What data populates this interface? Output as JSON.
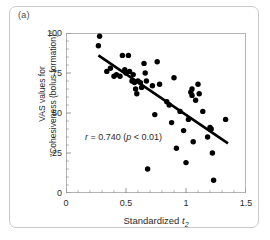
{
  "figure": {
    "panel_label": "(a)",
    "background_color": "#ffffff",
    "frame_color": "#c9c9c9"
  },
  "chart_data": {
    "type": "scatter",
    "title": "",
    "xlabel": "Standardized t2",
    "xlabel_parts": {
      "text": "Standardized ",
      "italic_symbol": "t",
      "subscript": "2"
    },
    "ylabel": "VAS values for \"Cohesiveness (bolus formation)\"",
    "ylabel_line1": "VAS values for",
    "ylabel_line2": "\"Cohesiveness (bolus formation)\"",
    "xlim": [
      0,
      1.5
    ],
    "ylim": [
      0,
      100
    ],
    "xticks": [
      0,
      0.5,
      1,
      1.5
    ],
    "xtick_labels": [
      "0",
      "0.5",
      "1",
      "1.5"
    ],
    "yticks": [
      0,
      25,
      50,
      75,
      100
    ],
    "ytick_labels": [
      "0",
      "25",
      "50",
      "75",
      "100"
    ],
    "xminor_tick_step": 0.1,
    "yminor_tick_step": 5,
    "grid": false,
    "legend": "none",
    "marker_color": "#000000",
    "marker_size": 4.2,
    "annotation": {
      "text": "r = 0.740 (p < 0.01)",
      "correlation_symbol": "r",
      "correlation_value": "0.740",
      "p_symbol": "p",
      "p_text": "< 0.01",
      "x": 0.26,
      "y": 27
    },
    "trendline": {
      "type": "linear-fit",
      "color": "#000000",
      "width": 2.6,
      "x_start": 0.27,
      "y_start": 86,
      "x_end": 1.35,
      "y_end": 31
    },
    "points": [
      {
        "x": 0.28,
        "y": 98
      },
      {
        "x": 0.27,
        "y": 92
      },
      {
        "x": 0.34,
        "y": 76
      },
      {
        "x": 0.37,
        "y": 78
      },
      {
        "x": 0.4,
        "y": 73
      },
      {
        "x": 0.42,
        "y": 74
      },
      {
        "x": 0.45,
        "y": 73
      },
      {
        "x": 0.47,
        "y": 86
      },
      {
        "x": 0.49,
        "y": 77
      },
      {
        "x": 0.5,
        "y": 75
      },
      {
        "x": 0.52,
        "y": 86
      },
      {
        "x": 0.53,
        "y": 76
      },
      {
        "x": 0.55,
        "y": 70
      },
      {
        "x": 0.56,
        "y": 74
      },
      {
        "x": 0.57,
        "y": 69
      },
      {
        "x": 0.58,
        "y": 65
      },
      {
        "x": 0.59,
        "y": 62
      },
      {
        "x": 0.6,
        "y": 70
      },
      {
        "x": 0.62,
        "y": 69
      },
      {
        "x": 0.63,
        "y": 66
      },
      {
        "x": 0.65,
        "y": 81
      },
      {
        "x": 0.66,
        "y": 75
      },
      {
        "x": 0.67,
        "y": 70
      },
      {
        "x": 0.68,
        "y": 15
      },
      {
        "x": 0.72,
        "y": 67
      },
      {
        "x": 0.74,
        "y": 49
      },
      {
        "x": 0.76,
        "y": 82
      },
      {
        "x": 0.78,
        "y": 68
      },
      {
        "x": 0.84,
        "y": 57
      },
      {
        "x": 0.86,
        "y": 55
      },
      {
        "x": 0.88,
        "y": 44
      },
      {
        "x": 0.9,
        "y": 72
      },
      {
        "x": 0.92,
        "y": 28
      },
      {
        "x": 0.95,
        "y": 51
      },
      {
        "x": 0.98,
        "y": 39
      },
      {
        "x": 1.0,
        "y": 19
      },
      {
        "x": 1.02,
        "y": 46
      },
      {
        "x": 1.04,
        "y": 63
      },
      {
        "x": 1.05,
        "y": 61
      },
      {
        "x": 1.05,
        "y": 65
      },
      {
        "x": 1.06,
        "y": 32
      },
      {
        "x": 1.08,
        "y": 58
      },
      {
        "x": 1.1,
        "y": 68
      },
      {
        "x": 1.11,
        "y": 62
      },
      {
        "x": 1.14,
        "y": 51
      },
      {
        "x": 1.18,
        "y": 35
      },
      {
        "x": 1.2,
        "y": 41
      },
      {
        "x": 1.21,
        "y": 40
      },
      {
        "x": 1.22,
        "y": 25
      },
      {
        "x": 1.23,
        "y": 8
      },
      {
        "x": 1.33,
        "y": 46
      }
    ]
  }
}
